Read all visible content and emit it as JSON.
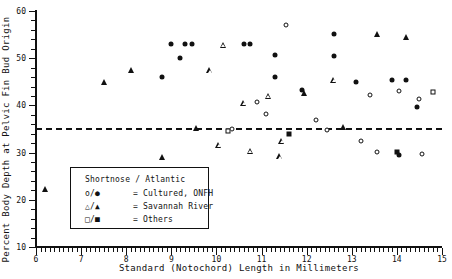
{
  "chart_data": {
    "type": "scatter",
    "title": "",
    "xlabel": "Standard (Notochord) Length in Millimeters",
    "ylabel": "Percent Body Depth at Pelvic Fin Bud Origin",
    "xlim": [
      6,
      15
    ],
    "ylim": [
      10,
      60
    ],
    "xticks": [
      6,
      7,
      8,
      9,
      10,
      11,
      12,
      13,
      14,
      15
    ],
    "yticks": [
      10,
      20,
      30,
      40,
      50,
      60
    ],
    "xminor_step": 0.1,
    "yminor_step": 2,
    "grid": false,
    "legend_position": "lower-left-inside",
    "reference_line": {
      "orientation": "horizontal",
      "y": 35.2,
      "style": "dashed"
    },
    "series": [
      {
        "name": "Cultured, ONFH (Shortnose)",
        "marker": "open-circle",
        "points": [
          [
            10.35,
            35.0
          ],
          [
            10.9,
            40.7
          ],
          [
            11.1,
            38.2
          ],
          [
            11.55,
            57.0
          ],
          [
            12.2,
            36.9
          ],
          [
            12.45,
            34.8
          ],
          [
            13.2,
            32.4
          ],
          [
            13.4,
            42.1
          ],
          [
            13.55,
            30.2
          ],
          [
            14.05,
            43.0
          ],
          [
            14.5,
            41.3
          ],
          [
            14.55,
            29.7
          ]
        ]
      },
      {
        "name": "Cultured, ONFH (Atlantic)",
        "marker": "filled-circle",
        "points": [
          [
            8.8,
            46.0
          ],
          [
            9.0,
            53.0
          ],
          [
            9.3,
            53.0
          ],
          [
            9.45,
            53.0
          ],
          [
            9.2,
            50.0
          ],
          [
            10.6,
            53.1
          ],
          [
            10.75,
            53.1
          ],
          [
            11.3,
            50.6
          ],
          [
            11.3,
            46.0
          ],
          [
            11.9,
            43.2
          ],
          [
            12.6,
            55.1
          ],
          [
            12.6,
            50.4
          ],
          [
            13.1,
            45.0
          ],
          [
            13.9,
            45.4
          ],
          [
            14.2,
            45.4
          ],
          [
            14.45,
            39.6
          ],
          [
            14.05,
            29.4
          ]
        ]
      },
      {
        "name": "Savannah River (Shortnose)",
        "marker": "open-triangle",
        "points": [
          [
            10.15,
            52.9
          ],
          [
            9.85,
            48.7
          ],
          [
            10.6,
            43.1
          ],
          [
            11.15,
            45.9
          ],
          [
            10.05,
            36.8
          ],
          [
            10.75,
            36.7
          ],
          [
            12.6,
            53.0
          ],
          [
            11.4,
            38.1
          ],
          [
            11.45,
            42.7
          ]
        ]
      },
      {
        "name": "Savannah River (Atlantic)",
        "marker": "filled-triangle",
        "points": [
          [
            6.2,
            22.3
          ],
          [
            7.5,
            44.9
          ],
          [
            8.1,
            47.4
          ],
          [
            8.8,
            29.1
          ],
          [
            9.55,
            35.3
          ],
          [
            11.95,
            42.6
          ],
          [
            13.55,
            55.1
          ],
          [
            12.8,
            35.5
          ],
          [
            14.2,
            54.4
          ]
        ]
      },
      {
        "name": "Others (Shortnose)",
        "marker": "open-square",
        "points": [
          [
            10.25,
            34.5
          ],
          [
            14.8,
            42.8
          ]
        ]
      },
      {
        "name": "Others (Atlantic)",
        "marker": "filled-square",
        "points": [
          [
            11.6,
            33.9
          ],
          [
            14.0,
            30.1
          ]
        ]
      }
    ]
  },
  "legend": {
    "title": "Shortnose / Atlantic",
    "rows": [
      {
        "symbols": "o/●",
        "text": "= Cultured, ONFH"
      },
      {
        "symbols": "△/▲",
        "text": "= Savannah River"
      },
      {
        "symbols": "□/■",
        "text": "= Others"
      }
    ]
  }
}
